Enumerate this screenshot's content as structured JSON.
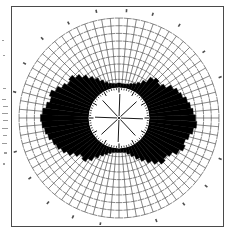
{
  "document": {
    "type": "scanned-figure",
    "title": "Polar rose diagram",
    "background_color": "#ffffff",
    "frame_color": "#4a4a4a",
    "ink_color": "#000000",
    "grid_color": "#555555"
  },
  "figure": {
    "center_x": 107,
    "center_y": 111,
    "inner_circle_radius": 31,
    "grid_outer_radius": 100,
    "spoke_count": 72,
    "grid_ring_count": 9,
    "inner_spoke_count": 8,
    "inner_tick_count": 72
  },
  "chart_data": {
    "type": "bar",
    "title": "Polar rose diagram",
    "subtitle": "",
    "xlabel": "",
    "ylabel": "",
    "grid": true,
    "legend_position": "none",
    "axis_note": "angles in degrees clockwise from top (north)",
    "rlim": [
      0,
      100
    ],
    "r_base": 31,
    "categories": [
      "0",
      "5",
      "10",
      "15",
      "20",
      "25",
      "30",
      "35",
      "40",
      "45",
      "50",
      "55",
      "60",
      "65",
      "70",
      "75",
      "80",
      "85",
      "90",
      "95",
      "100",
      "105",
      "110",
      "115",
      "120",
      "125",
      "130",
      "135",
      "140",
      "145",
      "150",
      "155",
      "160",
      "165",
      "170",
      "175",
      "180",
      "185",
      "190",
      "195",
      "200",
      "205",
      "210",
      "215",
      "220",
      "225",
      "230",
      "235",
      "240",
      "245",
      "250",
      "255",
      "260",
      "265",
      "270",
      "275",
      "280",
      "285",
      "290",
      "295",
      "300",
      "305",
      "310",
      "315",
      "320",
      "325",
      "330",
      "335",
      "340",
      "345",
      "350",
      "355"
    ],
    "values": [
      6,
      5,
      5,
      6,
      8,
      10,
      14,
      20,
      30,
      34,
      31,
      36,
      44,
      49,
      52,
      57,
      60,
      63,
      66,
      68,
      64,
      60,
      56,
      59,
      54,
      47,
      43,
      46,
      40,
      33,
      26,
      20,
      14,
      9,
      6,
      5,
      5,
      5,
      6,
      8,
      11,
      15,
      21,
      29,
      35,
      32,
      38,
      45,
      50,
      54,
      57,
      61,
      64,
      67,
      69,
      66,
      62,
      58,
      61,
      55,
      49,
      44,
      47,
      41,
      34,
      27,
      21,
      15,
      10,
      7,
      6,
      5
    ],
    "series": [
      {
        "name": "frequency",
        "values": [
          6,
          5,
          5,
          6,
          8,
          10,
          14,
          20,
          30,
          34,
          31,
          36,
          44,
          49,
          52,
          57,
          60,
          63,
          66,
          68,
          64,
          60,
          56,
          59,
          54,
          47,
          43,
          46,
          40,
          33,
          26,
          20,
          14,
          9,
          6,
          5,
          5,
          5,
          6,
          8,
          11,
          15,
          21,
          29,
          35,
          32,
          38,
          45,
          50,
          54,
          57,
          61,
          64,
          67,
          69,
          66,
          62,
          58,
          61,
          55,
          49,
          44,
          47,
          41,
          34,
          27,
          21,
          15,
          10,
          7,
          6,
          5
        ]
      }
    ]
  }
}
